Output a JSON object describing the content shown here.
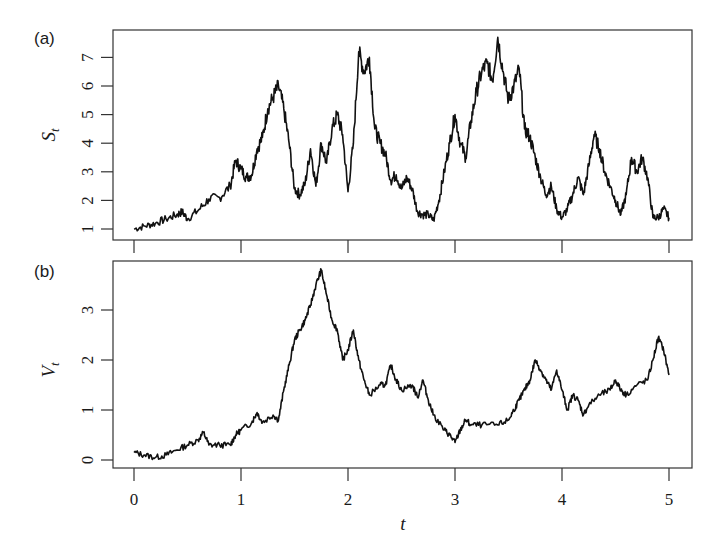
{
  "chart_data": [
    {
      "type": "line",
      "panel_label": "(a)",
      "title": "",
      "xlabel": "",
      "ylabel": "S_t",
      "ylabel_main": "S",
      "ylabel_sub": "t",
      "xlim": [
        0,
        5
      ],
      "ylim": [
        0.9,
        7.9
      ],
      "yticks": [
        1,
        2,
        3,
        4,
        5,
        6,
        7
      ],
      "xticks": [
        0,
        1,
        2,
        3,
        4,
        5
      ],
      "grid": false,
      "series": [
        {
          "name": "S_t",
          "x": [
            0,
            0.1,
            0.2,
            0.3,
            0.4,
            0.45,
            0.5,
            0.6,
            0.7,
            0.8,
            0.9,
            0.95,
            1.0,
            1.05,
            1.1,
            1.15,
            1.2,
            1.25,
            1.3,
            1.35,
            1.4,
            1.45,
            1.5,
            1.55,
            1.6,
            1.65,
            1.7,
            1.75,
            1.8,
            1.85,
            1.9,
            1.95,
            2.0,
            2.05,
            2.1,
            2.15,
            2.2,
            2.25,
            2.3,
            2.35,
            2.4,
            2.45,
            2.5,
            2.55,
            2.6,
            2.65,
            2.7,
            2.75,
            2.8,
            2.85,
            2.9,
            2.95,
            3.0,
            3.05,
            3.1,
            3.15,
            3.2,
            3.25,
            3.3,
            3.35,
            3.4,
            3.45,
            3.5,
            3.55,
            3.6,
            3.65,
            3.7,
            3.75,
            3.8,
            3.85,
            3.9,
            3.95,
            4.0,
            4.05,
            4.1,
            4.15,
            4.2,
            4.25,
            4.3,
            4.35,
            4.4,
            4.45,
            4.5,
            4.55,
            4.6,
            4.65,
            4.7,
            4.75,
            4.8,
            4.85,
            4.9,
            4.95,
            5.0
          ],
          "values": [
            1.0,
            1.1,
            1.2,
            1.35,
            1.5,
            1.6,
            1.35,
            1.65,
            2.05,
            2.1,
            2.5,
            3.4,
            3.1,
            2.8,
            2.9,
            3.8,
            4.2,
            5.2,
            5.6,
            6.0,
            5.2,
            4.0,
            2.4,
            2.2,
            2.6,
            3.8,
            2.5,
            4.0,
            3.3,
            4.5,
            5.0,
            4.3,
            2.3,
            4.0,
            7.2,
            6.5,
            7.0,
            4.5,
            4.0,
            3.6,
            2.7,
            2.9,
            2.4,
            2.8,
            2.4,
            1.6,
            1.5,
            1.5,
            1.3,
            2.0,
            3.0,
            4.0,
            5.0,
            4.0,
            3.5,
            4.8,
            5.8,
            6.5,
            6.8,
            6.2,
            7.7,
            6.5,
            5.5,
            6.0,
            6.6,
            4.5,
            4.2,
            3.5,
            2.8,
            2.2,
            2.5,
            1.7,
            1.4,
            1.7,
            2.2,
            2.8,
            2.2,
            3.2,
            4.3,
            3.8,
            3.0,
            2.5,
            2.0,
            1.5,
            2.2,
            3.5,
            3.0,
            3.5,
            2.8,
            1.4,
            1.4,
            1.7,
            1.4
          ]
        }
      ]
    },
    {
      "type": "line",
      "panel_label": "(b)",
      "title": "",
      "xlabel": "t",
      "ylabel": "V_t",
      "ylabel_main": "V",
      "ylabel_sub": "t",
      "xlim": [
        0,
        5
      ],
      "ylim": [
        -0.1,
        4.0
      ],
      "yticks": [
        0,
        1,
        2,
        3
      ],
      "xticks": [
        0,
        1,
        2,
        3,
        4,
        5
      ],
      "grid": false,
      "series": [
        {
          "name": "V_t",
          "x": [
            0,
            0.1,
            0.2,
            0.3,
            0.4,
            0.5,
            0.6,
            0.65,
            0.7,
            0.8,
            0.9,
            0.95,
            1.0,
            1.1,
            1.15,
            1.2,
            1.3,
            1.35,
            1.4,
            1.45,
            1.5,
            1.55,
            1.6,
            1.65,
            1.7,
            1.75,
            1.8,
            1.85,
            1.9,
            1.95,
            2.0,
            2.05,
            2.1,
            2.15,
            2.2,
            2.3,
            2.35,
            2.4,
            2.45,
            2.5,
            2.6,
            2.65,
            2.7,
            2.75,
            2.8,
            2.9,
            2.95,
            3.0,
            3.05,
            3.1,
            3.15,
            3.25,
            3.4,
            3.5,
            3.55,
            3.6,
            3.65,
            3.7,
            3.75,
            3.8,
            3.85,
            3.9,
            3.95,
            4.0,
            4.05,
            4.1,
            4.15,
            4.2,
            4.25,
            4.35,
            4.45,
            4.5,
            4.55,
            4.6,
            4.7,
            4.8,
            4.85,
            4.9,
            4.95,
            5.0
          ],
          "values": [
            0.15,
            0.1,
            0.05,
            0.1,
            0.2,
            0.3,
            0.4,
            0.55,
            0.3,
            0.3,
            0.3,
            0.5,
            0.6,
            0.75,
            0.95,
            0.75,
            0.9,
            0.8,
            1.4,
            1.9,
            2.4,
            2.6,
            2.8,
            3.1,
            3.5,
            3.8,
            3.3,
            2.8,
            2.6,
            2.0,
            2.2,
            2.6,
            2.0,
            1.6,
            1.3,
            1.5,
            1.5,
            1.9,
            1.6,
            1.4,
            1.5,
            1.25,
            1.6,
            1.2,
            0.9,
            0.6,
            0.5,
            0.35,
            0.6,
            0.8,
            0.7,
            0.7,
            0.7,
            0.8,
            1.0,
            1.2,
            1.4,
            1.6,
            2.0,
            1.8,
            1.6,
            1.4,
            1.8,
            1.4,
            1.0,
            1.3,
            1.2,
            0.9,
            1.1,
            1.3,
            1.4,
            1.6,
            1.4,
            1.3,
            1.5,
            1.6,
            2.0,
            2.45,
            2.2,
            1.7
          ]
        }
      ]
    }
  ],
  "figure": {
    "panels": [
      {
        "label": "(a)",
        "ylabel_main": "S",
        "ylabel_sub": "t",
        "ytick_labels": [
          "1",
          "2",
          "3",
          "4",
          "5",
          "6",
          "7"
        ]
      },
      {
        "label": "(b)",
        "ylabel_main": "V",
        "ylabel_sub": "t",
        "ytick_labels": [
          "0",
          "1",
          "2",
          "3"
        ]
      }
    ],
    "xtick_labels": [
      "0",
      "1",
      "2",
      "3",
      "4",
      "5"
    ],
    "xlabel": "t",
    "line_color": "#111111",
    "frame_color": "#333333"
  }
}
